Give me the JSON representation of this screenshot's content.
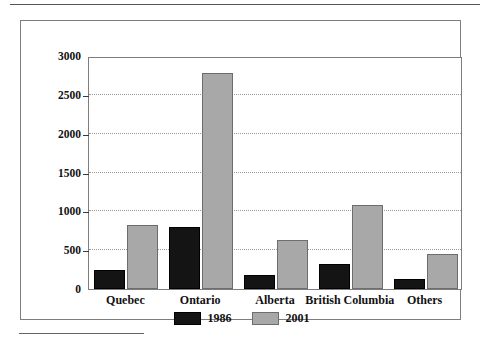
{
  "figure": {
    "top_rule": "",
    "footnote_rule": ""
  },
  "chart_data": {
    "type": "bar",
    "title": "",
    "subtitle": "",
    "xlabel": "",
    "ylabel": "",
    "categories": [
      "Quebec",
      "Ontario",
      "Alberta",
      "British Columbia",
      "Others"
    ],
    "series": [
      {
        "name": "1986",
        "color": "#141414",
        "values": [
          245,
          800,
          180,
          325,
          130
        ]
      },
      {
        "name": "2001",
        "color": "#a8a8a8",
        "values": [
          830,
          2780,
          630,
          1080,
          445
        ]
      }
    ],
    "ylim": [
      0,
      3000
    ],
    "yticks": [
      0,
      500,
      1000,
      1500,
      2000,
      2500,
      3000
    ],
    "ytick_labels": [
      "0",
      "500",
      "1000",
      "1500",
      "2000",
      "2500",
      "3000"
    ],
    "grid": true,
    "grid_style": "dotted-horizontal",
    "legend": {
      "position": "bottom-center",
      "entries": [
        {
          "label": "1986",
          "color": "#141414"
        },
        {
          "label": "2001",
          "color": "#a8a8a8"
        }
      ]
    }
  }
}
